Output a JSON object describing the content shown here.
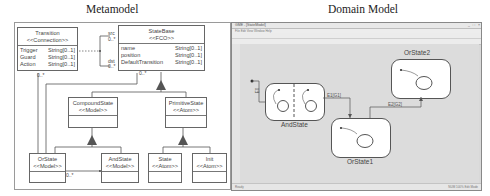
{
  "figure": {
    "left_title": "Metamodel",
    "right_title": "Domain Model"
  },
  "metamodel": {
    "classes": [
      {
        "id": "transition",
        "name": "Transition",
        "stereotype": "<<Connection>>",
        "attributes": [
          {
            "name": "Trigger",
            "type": "String[0..1]"
          },
          {
            "name": "Guard",
            "type": "String[0..1]"
          },
          {
            "name": "Action",
            "type": "String[0..1]"
          }
        ]
      },
      {
        "id": "statebase",
        "name": "StateBase",
        "stereotype": "<<FCO>>",
        "attributes": [
          {
            "name": "name",
            "type": "String[0..1]"
          },
          {
            "name": "position",
            "type": "String[0..1]"
          },
          {
            "name": "DefaultTransition",
            "type": "String[0..1]"
          }
        ]
      },
      {
        "id": "compoundstate",
        "name": "CompoundState",
        "stereotype": "<<Model>>",
        "attributes": []
      },
      {
        "id": "primitivestate",
        "name": "PrimitiveState",
        "stereotype": "<<Atom>>",
        "attributes": []
      },
      {
        "id": "orstate",
        "name": "OrState",
        "stereotype": "<<Model>>",
        "attributes": []
      },
      {
        "id": "andstate",
        "name": "AndState",
        "stereotype": "<<Model>>",
        "attributes": []
      },
      {
        "id": "state",
        "name": "State",
        "stereotype": "<<Atom>>",
        "attributes": []
      },
      {
        "id": "init",
        "name": "Init",
        "stereotype": "<<Atom>>",
        "attributes": []
      }
    ],
    "multiplicities": {
      "src_role": "src",
      "src_mult": "0..*",
      "dst_role": "dst",
      "dst_mult": "0..*",
      "transition_containment": "0..*",
      "statebase_containment": "0..*",
      "orstate_andstate": "0..*"
    }
  },
  "domain_model": {
    "window": {
      "title": "GME - [StateModel]",
      "menu": "File  Edit  View  Window  Help",
      "status_left": "Ready",
      "status_right": "NUM  100%  Edit Mode"
    },
    "states": [
      {
        "name": "AndState"
      },
      {
        "name": "OrState1"
      },
      {
        "name": "OrState2"
      }
    ],
    "edges": [
      {
        "label": "E1[G1]"
      },
      {
        "label": "E2[G2]"
      },
      {
        "label": "E0"
      }
    ]
  }
}
